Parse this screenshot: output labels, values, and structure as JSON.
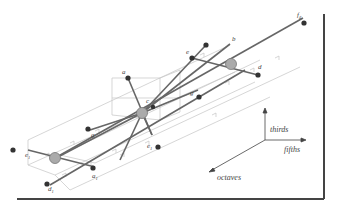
{
  "diagram": {
    "axes": {
      "thirds": "thirds",
      "fifths": "fifths",
      "octaves": "octaves"
    },
    "nodes": {
      "a": "a",
      "b": "b",
      "c": "c",
      "d": "d",
      "e": "e",
      "f": "f",
      "f_sub": "♯",
      "g": "g",
      "e1": "e",
      "e1_sub": "1",
      "g1": "g",
      "a1": "a",
      "a1_sub": "1",
      "d1": "d",
      "d1_sub": "1",
      "c1": "e",
      "c1_sub": "1"
    },
    "colors": {
      "line": "#555555",
      "grid": "#bbbbbb",
      "node": "#333333",
      "centroid": "#aaaaaa",
      "frame": "#444444"
    }
  }
}
